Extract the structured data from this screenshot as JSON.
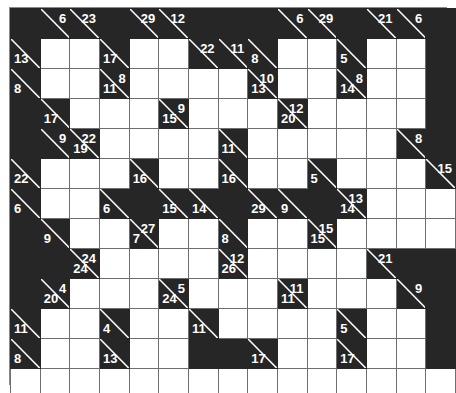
{
  "puzzle": {
    "name": "kakuro-grid",
    "type": "kakuro",
    "columns": 15,
    "rows": 13,
    "cell_size_px": 30,
    "colors": {
      "block": "#262626",
      "white": "#ffffff",
      "grid_line": "#6e6e6e",
      "clue_text": "#ffffff",
      "outer_border": "#8a8a8a"
    }
  },
  "legend": {
    "down_clue_position": "upper-right",
    "across_clue_position": "lower-left"
  },
  "grid": [
    [
      {
        "t": "block"
      },
      {
        "t": "clue",
        "down": "6"
      },
      {
        "t": "clue",
        "down": "23"
      },
      {
        "t": "block"
      },
      {
        "t": "clue",
        "down": "29"
      },
      {
        "t": "clue",
        "down": "12"
      },
      {
        "t": "block"
      },
      {
        "t": "block"
      },
      {
        "t": "block"
      },
      {
        "t": "clue",
        "down": "6"
      },
      {
        "t": "clue",
        "down": "29"
      },
      {
        "t": "block"
      },
      {
        "t": "clue",
        "down": "21"
      },
      {
        "t": "clue",
        "down": "6"
      },
      {
        "t": "block"
      }
    ],
    [
      {
        "t": "clue",
        "across": "13"
      },
      {
        "t": "white"
      },
      {
        "t": "white"
      },
      {
        "t": "clue",
        "across": "17"
      },
      {
        "t": "white"
      },
      {
        "t": "white"
      },
      {
        "t": "clue",
        "down": "22"
      },
      {
        "t": "clue",
        "down": "11"
      },
      {
        "t": "clue",
        "across": "8"
      },
      {
        "t": "white"
      },
      {
        "t": "white"
      },
      {
        "t": "clue",
        "across": "5"
      },
      {
        "t": "white"
      },
      {
        "t": "white"
      },
      {
        "t": "block"
      }
    ],
    [
      {
        "t": "clue",
        "across": "8"
      },
      {
        "t": "white"
      },
      {
        "t": "white"
      },
      {
        "t": "clue",
        "across": "11",
        "down": "8"
      },
      {
        "t": "white"
      },
      {
        "t": "white"
      },
      {
        "t": "white"
      },
      {
        "t": "white"
      },
      {
        "t": "clue",
        "across": "13",
        "down": "10"
      },
      {
        "t": "white"
      },
      {
        "t": "white"
      },
      {
        "t": "clue",
        "across": "14",
        "down": "8"
      },
      {
        "t": "white"
      },
      {
        "t": "white"
      },
      {
        "t": "block"
      }
    ],
    [
      {
        "t": "block"
      },
      {
        "t": "clue",
        "across": "17"
      },
      {
        "t": "white"
      },
      {
        "t": "white"
      },
      {
        "t": "white"
      },
      {
        "t": "clue",
        "across": "15",
        "down": "9"
      },
      {
        "t": "white"
      },
      {
        "t": "white"
      },
      {
        "t": "white"
      },
      {
        "t": "clue",
        "across": "20",
        "down": "12"
      },
      {
        "t": "white"
      },
      {
        "t": "white"
      },
      {
        "t": "white"
      },
      {
        "t": "white"
      },
      {
        "t": "block"
      }
    ],
    [
      {
        "t": "block"
      },
      {
        "t": "clue",
        "down": "9"
      },
      {
        "t": "clue",
        "across": "19",
        "down": "22"
      },
      {
        "t": "white"
      },
      {
        "t": "white"
      },
      {
        "t": "white"
      },
      {
        "t": "white"
      },
      {
        "t": "clue",
        "across": "11"
      },
      {
        "t": "white"
      },
      {
        "t": "white"
      },
      {
        "t": "white"
      },
      {
        "t": "white"
      },
      {
        "t": "white"
      },
      {
        "t": "clue",
        "down": "8"
      },
      {
        "t": "block"
      }
    ],
    [
      {
        "t": "clue",
        "across": "22"
      },
      {
        "t": "white"
      },
      {
        "t": "white"
      },
      {
        "t": "white"
      },
      {
        "t": "clue",
        "across": "16"
      },
      {
        "t": "white"
      },
      {
        "t": "white"
      },
      {
        "t": "clue",
        "across": "16"
      },
      {
        "t": "white"
      },
      {
        "t": "white"
      },
      {
        "t": "clue",
        "across": "5"
      },
      {
        "t": "white"
      },
      {
        "t": "white"
      },
      {
        "t": "white"
      },
      {
        "t": "clue",
        "down": "15"
      }
    ],
    [
      {
        "t": "clue",
        "across": "6"
      },
      {
        "t": "white"
      },
      {
        "t": "white"
      },
      {
        "t": "clue",
        "across": "6"
      },
      {
        "t": "block"
      },
      {
        "t": "clue",
        "across": "15"
      },
      {
        "t": "clue",
        "across": "14"
      },
      {
        "t": "block"
      },
      {
        "t": "clue",
        "across": "29"
      },
      {
        "t": "clue",
        "across": "9"
      },
      {
        "t": "block"
      },
      {
        "t": "clue",
        "across": "14",
        "down": "13"
      },
      {
        "t": "white"
      },
      {
        "t": "white"
      },
      {
        "t": "white"
      }
    ],
    [
      {
        "t": "block"
      },
      {
        "t": "clue",
        "across": "9"
      },
      {
        "t": "white"
      },
      {
        "t": "white"
      },
      {
        "t": "clue",
        "across": "7",
        "down": "27"
      },
      {
        "t": "white"
      },
      {
        "t": "white"
      },
      {
        "t": "clue",
        "across": "8"
      },
      {
        "t": "white"
      },
      {
        "t": "white"
      },
      {
        "t": "clue",
        "across": "15",
        "down": "15"
      },
      {
        "t": "white"
      },
      {
        "t": "white"
      },
      {
        "t": "white"
      },
      {
        "t": "white"
      }
    ],
    [
      {
        "t": "block"
      },
      {
        "t": "block"
      },
      {
        "t": "clue",
        "across": "24",
        "down": "24"
      },
      {
        "t": "white"
      },
      {
        "t": "white"
      },
      {
        "t": "white"
      },
      {
        "t": "white"
      },
      {
        "t": "clue",
        "across": "26",
        "down": "12"
      },
      {
        "t": "white"
      },
      {
        "t": "white"
      },
      {
        "t": "white"
      },
      {
        "t": "white"
      },
      {
        "t": "clue",
        "down": "21"
      },
      {
        "t": "block"
      },
      {
        "t": "block"
      }
    ],
    [
      {
        "t": "block"
      },
      {
        "t": "clue",
        "across": "20",
        "down": "4"
      },
      {
        "t": "white"
      },
      {
        "t": "white"
      },
      {
        "t": "white"
      },
      {
        "t": "clue",
        "across": "24",
        "down": "5"
      },
      {
        "t": "white"
      },
      {
        "t": "white"
      },
      {
        "t": "white"
      },
      {
        "t": "clue",
        "across": "11",
        "down": "11"
      },
      {
        "t": "white"
      },
      {
        "t": "white"
      },
      {
        "t": "white"
      },
      {
        "t": "clue",
        "down": "9"
      },
      {
        "t": "block"
      }
    ],
    [
      {
        "t": "clue",
        "across": "11"
      },
      {
        "t": "white"
      },
      {
        "t": "white"
      },
      {
        "t": "clue",
        "across": "4"
      },
      {
        "t": "white"
      },
      {
        "t": "white"
      },
      {
        "t": "clue",
        "across": "11"
      },
      {
        "t": "white"
      },
      {
        "t": "white"
      },
      {
        "t": "white"
      },
      {
        "t": "white"
      },
      {
        "t": "clue",
        "across": "5"
      },
      {
        "t": "white"
      },
      {
        "t": "white"
      },
      {
        "t": "block"
      }
    ],
    [
      {
        "t": "clue",
        "across": "8"
      },
      {
        "t": "white"
      },
      {
        "t": "white"
      },
      {
        "t": "clue",
        "across": "13"
      },
      {
        "t": "white"
      },
      {
        "t": "white"
      },
      {
        "t": "block"
      },
      {
        "t": "block"
      },
      {
        "t": "clue",
        "across": "17"
      },
      {
        "t": "white"
      },
      {
        "t": "white"
      },
      {
        "t": "clue",
        "across": "17"
      },
      {
        "t": "white"
      },
      {
        "t": "white"
      },
      {
        "t": "block"
      }
    ],
    [
      {
        "t": "white"
      },
      {
        "t": "white"
      },
      {
        "t": "white"
      },
      {
        "t": "white"
      },
      {
        "t": "white"
      },
      {
        "t": "white"
      },
      {
        "t": "white"
      },
      {
        "t": "white"
      },
      {
        "t": "white"
      },
      {
        "t": "white"
      },
      {
        "t": "white"
      },
      {
        "t": "white"
      },
      {
        "t": "white"
      },
      {
        "t": "white"
      },
      {
        "t": "white"
      }
    ]
  ]
}
